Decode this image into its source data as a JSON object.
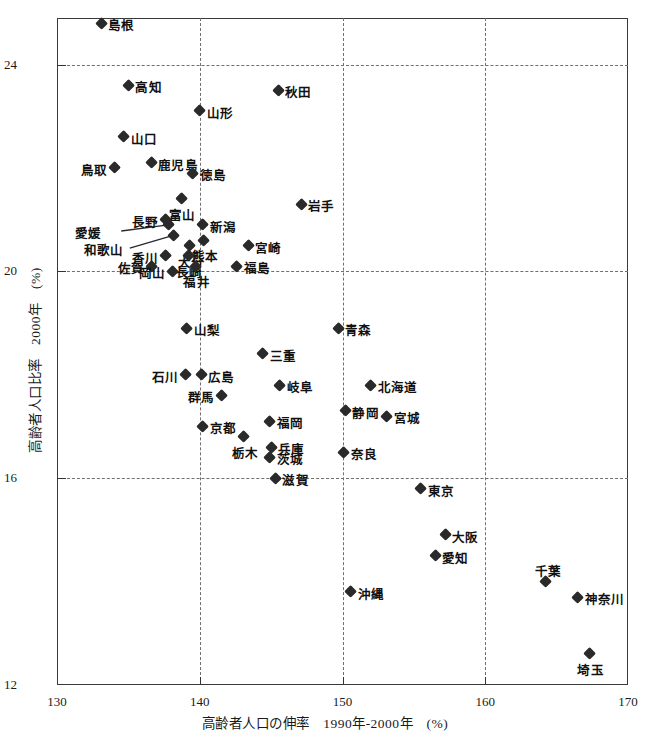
{
  "title": "",
  "axes": {
    "x_title": "高齢者人口の伸率　1990年-2000年　(%)",
    "y_title": "高齢者人口比率　2000年　(%)",
    "x_ticks": [
      "130",
      "140",
      "150",
      "160",
      "170"
    ],
    "y_ticks": [
      "12",
      "16",
      "20",
      "24"
    ]
  },
  "chart_data": {
    "type": "scatter",
    "title": "",
    "xlabel": "高齢者人口の伸率　1990年-2000年　(%)",
    "ylabel": "高齢者人口比率　2000年　(%)",
    "xlim": [
      130,
      170
    ],
    "ylim": [
      12,
      24.9
    ],
    "xticks": [
      130,
      140,
      150,
      160,
      170
    ],
    "yticks": [
      12,
      16,
      20,
      24
    ],
    "grid": true,
    "legend": "none",
    "series_name": "都道府県",
    "points": [
      {
        "label": "島根",
        "x": 133.1,
        "y": 24.8,
        "pos": "right"
      },
      {
        "label": "高知",
        "x": 135.0,
        "y": 23.6,
        "pos": "right"
      },
      {
        "label": "秋田",
        "x": 145.5,
        "y": 23.5,
        "pos": "right"
      },
      {
        "label": "山形",
        "x": 140.0,
        "y": 23.1,
        "pos": "right"
      },
      {
        "label": "山口",
        "x": 134.7,
        "y": 22.6,
        "pos": "right"
      },
      {
        "label": "鹿児島",
        "x": 136.6,
        "y": 22.1,
        "pos": "right"
      },
      {
        "label": "鳥取",
        "x": 134.0,
        "y": 22.0,
        "pos": "left"
      },
      {
        "label": "徳島",
        "x": 139.5,
        "y": 21.9,
        "pos": "right"
      },
      {
        "label": "富山",
        "x": 138.7,
        "y": 21.4,
        "pos": "bottom"
      },
      {
        "label": "岩手",
        "x": 147.1,
        "y": 21.3,
        "pos": "right"
      },
      {
        "label": "長野",
        "x": 137.6,
        "y": 21.0,
        "pos": "left"
      },
      {
        "label": "新潟",
        "x": 140.2,
        "y": 20.9,
        "pos": "right"
      },
      {
        "label": "愛媛",
        "x": 137.8,
        "y": 20.9,
        "pos": "leader"
      },
      {
        "label": "和歌山",
        "x": 138.2,
        "y": 20.7,
        "pos": "leader"
      },
      {
        "label": "熊本",
        "x": 140.3,
        "y": 20.6,
        "pos": "bottom"
      },
      {
        "label": "大分",
        "x": 139.3,
        "y": 20.5,
        "pos": "bottom"
      },
      {
        "label": "宮崎",
        "x": 143.4,
        "y": 20.5,
        "pos": "right"
      },
      {
        "label": "香川",
        "x": 137.6,
        "y": 20.3,
        "pos": "left"
      },
      {
        "label": "長崎",
        "x": 139.2,
        "y": 20.3,
        "pos": "bottom"
      },
      {
        "label": "佐賀",
        "x": 136.6,
        "y": 20.1,
        "pos": "left"
      },
      {
        "label": "福井",
        "x": 139.7,
        "y": 20.1,
        "pos": "bottom"
      },
      {
        "label": "岡山",
        "x": 138.1,
        "y": 20.0,
        "pos": "left"
      },
      {
        "label": "福島",
        "x": 142.6,
        "y": 20.1,
        "pos": "right"
      },
      {
        "label": "山梨",
        "x": 139.1,
        "y": 18.9,
        "pos": "right"
      },
      {
        "label": "青森",
        "x": 149.7,
        "y": 18.9,
        "pos": "right"
      },
      {
        "label": "三重",
        "x": 144.4,
        "y": 18.4,
        "pos": "right"
      },
      {
        "label": "広島",
        "x": 140.1,
        "y": 18.0,
        "pos": "right"
      },
      {
        "label": "石川",
        "x": 139.0,
        "y": 18.0,
        "pos": "left"
      },
      {
        "label": "岐阜",
        "x": 145.6,
        "y": 17.8,
        "pos": "right"
      },
      {
        "label": "北海道",
        "x": 152.0,
        "y": 17.8,
        "pos": "right"
      },
      {
        "label": "群馬",
        "x": 141.5,
        "y": 17.6,
        "pos": "left"
      },
      {
        "label": "静岡",
        "x": 150.2,
        "y": 17.3,
        "pos": "right"
      },
      {
        "label": "宮城",
        "x": 153.1,
        "y": 17.2,
        "pos": "right"
      },
      {
        "label": "福岡",
        "x": 144.9,
        "y": 17.1,
        "pos": "right"
      },
      {
        "label": "京都",
        "x": 140.2,
        "y": 17.0,
        "pos": "right"
      },
      {
        "label": "栃木",
        "x": 143.1,
        "y": 16.8,
        "pos": "bottom"
      },
      {
        "label": "兵庫",
        "x": 145.0,
        "y": 16.6,
        "pos": "right"
      },
      {
        "label": "奈良",
        "x": 150.1,
        "y": 16.5,
        "pos": "right"
      },
      {
        "label": "茨城",
        "x": 144.9,
        "y": 16.4,
        "pos": "right"
      },
      {
        "label": "滋賀",
        "x": 145.3,
        "y": 16.0,
        "pos": "right"
      },
      {
        "label": "東京",
        "x": 155.5,
        "y": 15.8,
        "pos": "right"
      },
      {
        "label": "大阪",
        "x": 157.2,
        "y": 14.9,
        "pos": "right"
      },
      {
        "label": "愛知",
        "x": 156.5,
        "y": 14.5,
        "pos": "right"
      },
      {
        "label": "千葉",
        "x": 164.2,
        "y": 14.0,
        "pos": "top"
      },
      {
        "label": "沖縄",
        "x": 150.6,
        "y": 13.8,
        "pos": "right"
      },
      {
        "label": "神奈川",
        "x": 166.5,
        "y": 13.7,
        "pos": "right"
      },
      {
        "label": "埼玉",
        "x": 167.3,
        "y": 12.6,
        "pos": "bottom"
      }
    ],
    "leader_lines": [
      {
        "label": "愛媛",
        "from_x": 134.5,
        "from_y": 20.78,
        "to_x": 137.8,
        "to_y": 20.9
      },
      {
        "label": "和歌山",
        "from_x": 135.1,
        "from_y": 20.45,
        "to_x": 138.2,
        "to_y": 20.7
      }
    ]
  }
}
